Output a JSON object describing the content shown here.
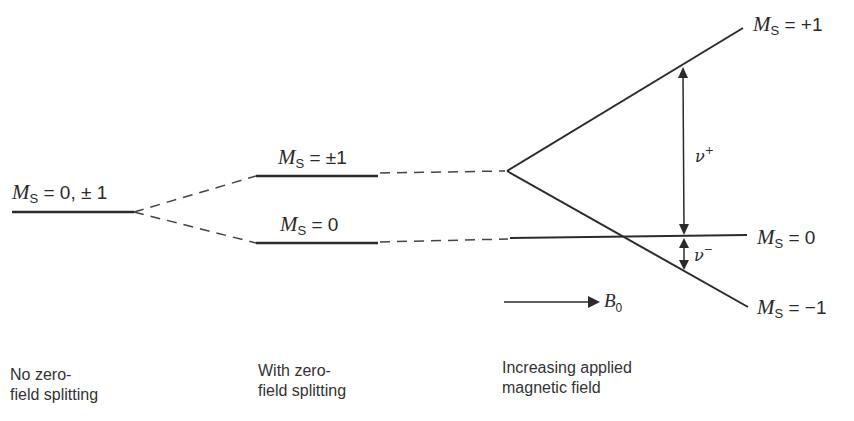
{
  "diagram": {
    "levels": {
      "no_zfs": {
        "symbol": "M",
        "subscript": "S",
        "value": "= 0, ± 1"
      },
      "zfs_upper": {
        "symbol": "M",
        "subscript": "S",
        "value": "= ±1"
      },
      "zfs_lower": {
        "symbol": "M",
        "subscript": "S",
        "value": "= 0"
      },
      "field_plus": {
        "symbol": "M",
        "subscript": "S",
        "value": "= +1"
      },
      "field_zero": {
        "symbol": "M",
        "subscript": "S",
        "value": "= 0"
      },
      "field_minus": {
        "symbol": "M",
        "subscript": "S",
        "value": "= −1"
      }
    },
    "transitions": {
      "nu_plus": {
        "symbol": "ν",
        "sup": "+"
      },
      "nu_minus": {
        "symbol": "ν",
        "sup": "−"
      }
    },
    "field_arrow": {
      "symbol": "B",
      "subscript": "0"
    },
    "captions": {
      "col1": [
        "No zero-",
        "field splitting"
      ],
      "col2": [
        "With zero-",
        "field splitting"
      ],
      "col3": [
        "Increasing applied",
        "magnetic field"
      ]
    },
    "colors": {
      "line": "#2b2b2b",
      "background": "#ffffff"
    }
  }
}
